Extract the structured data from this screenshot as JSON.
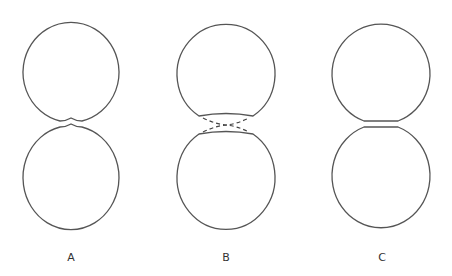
{
  "figure": {
    "panels": [
      {
        "id": "A",
        "label": "A",
        "description": "two spheres approaching with deformed contact region"
      },
      {
        "id": "B",
        "label": "B",
        "description": "two spheres with flattened faces and dashed bridging lines"
      },
      {
        "id": "C",
        "label": "C",
        "description": "two spheres with flattened parallel contact faces"
      }
    ],
    "colors": {
      "stroke": "#555555",
      "background": "#ffffff"
    }
  }
}
